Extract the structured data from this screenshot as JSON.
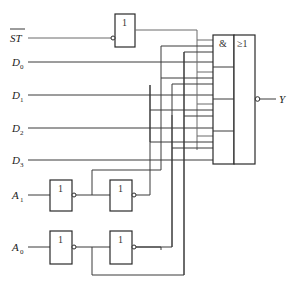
{
  "diagram": {
    "type": "logic-circuit",
    "inputs": [
      {
        "id": "ST",
        "label": "ST",
        "overline": true,
        "y": 38
      },
      {
        "id": "D0",
        "label": "D",
        "sub": "0",
        "y": 62
      },
      {
        "id": "D1",
        "label": "D",
        "sub": "1",
        "y": 95
      },
      {
        "id": "D2",
        "label": "D",
        "sub": "2",
        "y": 128
      },
      {
        "id": "D3",
        "label": "D",
        "sub": "3",
        "y": 160
      },
      {
        "id": "A1",
        "label": "A",
        "sub": "1",
        "y": 195
      },
      {
        "id": "A0",
        "label": "A",
        "sub": "0",
        "y": 247
      }
    ],
    "gates": {
      "st_not": {
        "symbol": "1",
        "input_inverted": true
      },
      "a1_not1": {
        "symbol": "1",
        "output_inverted": true
      },
      "a1_not2": {
        "symbol": "1",
        "output_inverted": true
      },
      "a0_not1": {
        "symbol": "1",
        "output_inverted": true
      },
      "a0_not2": {
        "symbol": "1",
        "output_inverted": true
      },
      "and_or": {
        "and_symbol": "&",
        "or_symbol": "≥1",
        "and_sections": 4,
        "output_inverted": true
      }
    },
    "output": {
      "id": "Y",
      "label": "Y"
    }
  }
}
